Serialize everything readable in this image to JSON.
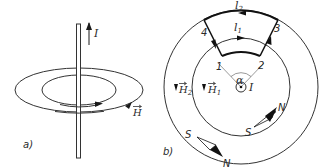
{
  "panel_a": {
    "caption": "a)",
    "current_label": "I",
    "field_label": "H"
  },
  "panel_b": {
    "caption": "b)",
    "path_labels": {
      "l1": "l",
      "l1_sub": "1",
      "l2": "l",
      "l2_sub": "2"
    },
    "points": [
      "1",
      "2",
      "3",
      "4"
    ],
    "angle_label": "α",
    "current_label": "I",
    "field_labels": {
      "h1": "H",
      "h1_sub": "1",
      "h2": "H",
      "h2_sub": "2"
    },
    "compass_inner": {
      "north": "N",
      "south": "S"
    },
    "compass_outer": {
      "north": "N",
      "south": "S"
    }
  }
}
